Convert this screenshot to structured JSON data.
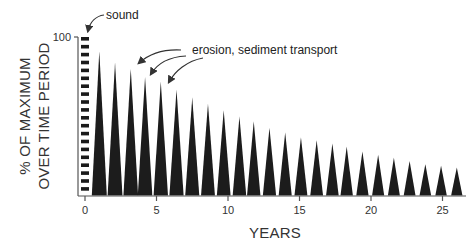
{
  "chart_data": {
    "type": "bar",
    "title": "",
    "xlabel": "YEARS",
    "ylabel": "% OF MAXIMUM OVER TIME PERIOD",
    "ylabel_lines": [
      "% OF MAXIMUM",
      "OVER TIME PERIOD"
    ],
    "xlim": [
      0,
      26.5
    ],
    "ylim": [
      0,
      100
    ],
    "x_ticks": [
      0,
      5,
      10,
      15,
      20,
      25
    ],
    "y_ticks": [
      100
    ],
    "grid": false,
    "legend": null,
    "series": [
      {
        "name": "sound",
        "style": "dashed vertical bar",
        "x": [
          0
        ],
        "values": [
          100
        ]
      },
      {
        "name": "erosion, sediment transport",
        "style": "triangular spikes",
        "x": [
          1.0,
          2.1,
          3.2,
          4.2,
          5.3,
          6.4,
          7.5,
          8.6,
          9.7,
          10.8,
          11.8,
          12.9,
          14.0,
          15.1,
          16.2,
          17.3,
          18.3,
          19.4,
          20.5,
          21.6,
          22.7,
          23.8,
          24.9,
          26.0
        ],
        "values": [
          91,
          84,
          80,
          75,
          72,
          67,
          62,
          58,
          54,
          50,
          47,
          43,
          40,
          37,
          35,
          33,
          31,
          28,
          26,
          24,
          22,
          20,
          19,
          18
        ]
      }
    ],
    "annotations": [
      {
        "text": "sound",
        "points_to": "sound bar top at year 0"
      },
      {
        "text": "erosion, sediment transport",
        "points_to": "spikes at years ~3, ~4, ~5"
      }
    ]
  }
}
